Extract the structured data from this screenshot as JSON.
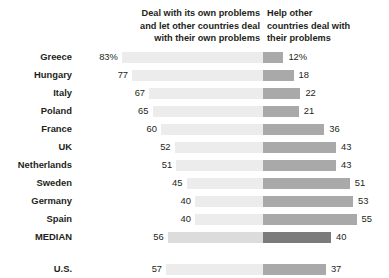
{
  "chart_data": {
    "type": "bar",
    "subtype": "diverging-stacked-bar",
    "title": "",
    "subtitle": "",
    "xlabel": "",
    "ylabel": "",
    "xlim": [
      0,
      100
    ],
    "grid": false,
    "legend_position": "top",
    "categories": [
      "Greece",
      "Hungary",
      "Italy",
      "Poland",
      "France",
      "UK",
      "Netherlands",
      "Sweden",
      "Germany",
      "Spain",
      "MEDIAN",
      "U.S."
    ],
    "series": [
      {
        "name": "Deal with its own problems and let other countries deal with their own problems",
        "color": "#ececec",
        "values": [
          83,
          77,
          67,
          65,
          60,
          52,
          51,
          45,
          40,
          40,
          56,
          57
        ]
      },
      {
        "name": "Help other countries deal with their problems",
        "color": "#a9a9a9",
        "values": [
          12,
          18,
          22,
          21,
          36,
          43,
          43,
          51,
          53,
          55,
          40,
          37
        ]
      }
    ],
    "value_labels_left": [
      "83%",
      "77",
      "67",
      "65",
      "60",
      "52",
      "51",
      "45",
      "40",
      "40",
      "56",
      "57"
    ],
    "value_labels_right": [
      "12%",
      "18",
      "22",
      "21",
      "36",
      "43",
      "43",
      "51",
      "53",
      "55",
      "40",
      "37"
    ],
    "highlight_row": "MEDIAN",
    "highlight_colors": {
      "left": "#dcdcdc",
      "right": "#7b7b7b"
    },
    "separated_row": "U.S."
  },
  "headers": {
    "left": "Deal with its own problems\nand let other countries deal\nwith their own problems",
    "right": "Help other\ncountries deal with\ntheir problems"
  },
  "rows": [
    {
      "label": "Greece",
      "left": 83,
      "right": 12,
      "left_label": "83%",
      "right_label": "12%"
    },
    {
      "label": "Hungary",
      "left": 77,
      "right": 18,
      "left_label": "77",
      "right_label": "18"
    },
    {
      "label": "Italy",
      "left": 67,
      "right": 22,
      "left_label": "67",
      "right_label": "22"
    },
    {
      "label": "Poland",
      "left": 65,
      "right": 21,
      "left_label": "65",
      "right_label": "21"
    },
    {
      "label": "France",
      "left": 60,
      "right": 36,
      "left_label": "60",
      "right_label": "36"
    },
    {
      "label": "UK",
      "left": 52,
      "right": 43,
      "left_label": "52",
      "right_label": "43"
    },
    {
      "label": "Netherlands",
      "left": 51,
      "right": 43,
      "left_label": "51",
      "right_label": "43"
    },
    {
      "label": "Sweden",
      "left": 45,
      "right": 51,
      "left_label": "45",
      "right_label": "51"
    },
    {
      "label": "Germany",
      "left": 40,
      "right": 53,
      "left_label": "40",
      "right_label": "53"
    },
    {
      "label": "Spain",
      "left": 40,
      "right": 55,
      "left_label": "40",
      "right_label": "55"
    },
    {
      "label": "MEDIAN",
      "left": 56,
      "right": 40,
      "left_label": "56",
      "right_label": "40",
      "highlight": true
    },
    {
      "label": "U.S.",
      "left": 57,
      "right": 37,
      "left_label": "57",
      "right_label": "37",
      "separated": true
    }
  ]
}
